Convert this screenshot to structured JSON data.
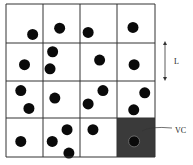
{
  "diagram": {
    "title": "",
    "grid": {
      "rows": 4,
      "cols": 4
    },
    "colors": {
      "line": "#333333",
      "particle": "#0a0a0a",
      "highlight_cell": "#3a3a3a",
      "background": "#ffffff"
    },
    "highlighted_cell": {
      "row": 3,
      "col": 3
    },
    "particles": [
      {
        "row": 0,
        "col": 0,
        "u": 0.72,
        "v": 0.78
      },
      {
        "row": 0,
        "col": 1,
        "u": 0.45,
        "v": 0.62
      },
      {
        "row": 0,
        "col": 2,
        "u": 0.22,
        "v": 0.73
      },
      {
        "row": 0,
        "col": 3,
        "u": 0.42,
        "v": 0.6
      },
      {
        "row": 1,
        "col": 0,
        "u": 0.5,
        "v": 0.57
      },
      {
        "row": 1,
        "col": 1,
        "u": 0.26,
        "v": 0.23
      },
      {
        "row": 1,
        "col": 1,
        "u": 0.19,
        "v": 0.68
      },
      {
        "row": 1,
        "col": 2,
        "u": 0.53,
        "v": 0.45
      },
      {
        "row": 1,
        "col": 3,
        "u": 0.45,
        "v": 0.57
      },
      {
        "row": 2,
        "col": 0,
        "u": 0.4,
        "v": 0.26
      },
      {
        "row": 2,
        "col": 0,
        "u": 0.62,
        "v": 0.74
      },
      {
        "row": 2,
        "col": 1,
        "u": 0.32,
        "v": 0.46
      },
      {
        "row": 2,
        "col": 2,
        "u": 0.62,
        "v": 0.26
      },
      {
        "row": 2,
        "col": 2,
        "u": 0.22,
        "v": 0.62
      },
      {
        "row": 2,
        "col": 3,
        "u": 0.73,
        "v": 0.32
      },
      {
        "row": 2,
        "col": 3,
        "u": 0.44,
        "v": 0.78
      },
      {
        "row": 3,
        "col": 0,
        "u": 0.4,
        "v": 0.6
      },
      {
        "row": 3,
        "col": 1,
        "u": 0.65,
        "v": 0.3
      },
      {
        "row": 3,
        "col": 1,
        "u": 0.25,
        "v": 0.6
      },
      {
        "row": 3,
        "col": 1,
        "u": 0.7,
        "v": 0.9
      },
      {
        "row": 3,
        "col": 2,
        "u": 0.35,
        "v": 0.3
      },
      {
        "row": 3,
        "col": 3,
        "u": 0.45,
        "v": 0.6
      }
    ],
    "annotations": {
      "length_label": "L",
      "cell_label": "VC"
    }
  }
}
